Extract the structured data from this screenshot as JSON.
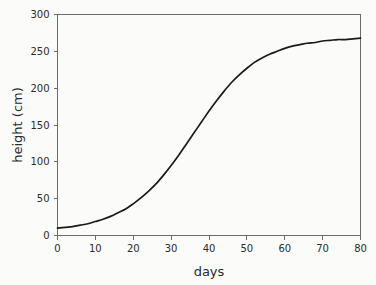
{
  "chart_data": {
    "type": "line",
    "title": "",
    "xlabel": "days",
    "ylabel": "height (cm)",
    "xlim": [
      0,
      80
    ],
    "ylim": [
      0,
      300
    ],
    "xticks": [
      0,
      10,
      20,
      30,
      40,
      50,
      60,
      70,
      80
    ],
    "yticks": [
      0,
      50,
      100,
      150,
      200,
      250,
      300
    ],
    "xtick_labels": [
      "0",
      "10",
      "20",
      "30",
      "40",
      "50",
      "60",
      "70",
      "80"
    ],
    "ytick_labels": [
      "0",
      "50",
      "100",
      "150",
      "200",
      "250",
      "300"
    ],
    "grid": false,
    "legend": null,
    "series": [
      {
        "name": "height",
        "x": [
          0,
          2,
          4,
          6,
          8,
          10,
          12,
          14,
          16,
          18,
          20,
          22,
          24,
          26,
          28,
          30,
          32,
          34,
          36,
          38,
          40,
          42,
          44,
          46,
          48,
          50,
          52,
          54,
          56,
          58,
          60,
          62,
          64,
          66,
          68,
          70,
          72,
          74,
          76,
          78,
          80
        ],
        "y": [
          10,
          11,
          12,
          14,
          16,
          19,
          22,
          26,
          31,
          36,
          43,
          51,
          60,
          70,
          82,
          95,
          109,
          124,
          139,
          154,
          169,
          183,
          196,
          208,
          218,
          227,
          235,
          241,
          246,
          250,
          254,
          257,
          259,
          261,
          262,
          264,
          265,
          266,
          266,
          267,
          268
        ]
      }
    ],
    "curve_model": {
      "shape": "logistic",
      "asymptote": 277,
      "inflection_day": 39,
      "start_value": 10,
      "end_value": 268
    }
  },
  "axes": {
    "x_axis_label": "days",
    "y_axis_label": "height (cm)"
  },
  "colors": {
    "background": "#fbfbfa",
    "curve": "#1a1a1a",
    "frame": "#6b6b6b",
    "text": "#2b2b2b"
  }
}
